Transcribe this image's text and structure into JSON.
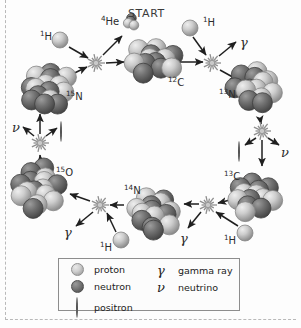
{
  "diagram": {
    "start_label": "START",
    "background": "#fdfdfd",
    "proton_color": "#cfcfcf",
    "neutron_color": "#6a6a6a",
    "arrow_color": "#1f1f1f",
    "burst_color": "#9a9a9a"
  },
  "nuclei": [
    {
      "name": "carbon-12",
      "label_sup": "12",
      "label_el": "C",
      "x": 150,
      "y": 60,
      "r": 27,
      "protons": 6,
      "neutrons": 6,
      "lx": 168,
      "ly": 76
    },
    {
      "name": "nitrogen-13",
      "label_sup": "13",
      "label_el": "N",
      "x": 258,
      "y": 90,
      "r": 27,
      "protons": 7,
      "neutrons": 6,
      "lx": 219,
      "ly": 88
    },
    {
      "name": "carbon-13",
      "label_sup": "13",
      "label_el": "C",
      "x": 258,
      "y": 196,
      "r": 27,
      "protons": 6,
      "neutrons": 7,
      "lx": 224,
      "ly": 170
    },
    {
      "name": "nitrogen-14",
      "label_sup": "14",
      "label_el": "N",
      "x": 150,
      "y": 212,
      "r": 27,
      "protons": 7,
      "neutrons": 7,
      "lx": 124,
      "ly": 184
    },
    {
      "name": "oxygen-15",
      "label_sup": "15",
      "label_el": "O",
      "x": 42,
      "y": 190,
      "r": 27,
      "protons": 8,
      "neutrons": 7,
      "lx": 56,
      "ly": 166
    },
    {
      "name": "nitrogen-15",
      "label_sup": "15",
      "label_el": "N",
      "x": 45,
      "y": 86,
      "r": 27,
      "protons": 7,
      "neutrons": 8,
      "lx": 66,
      "ly": 90
    },
    {
      "name": "helium-4",
      "label_sup": "4",
      "label_el": "He",
      "x": 131,
      "y": 22,
      "r": 13,
      "protons": 2,
      "neutrons": 2,
      "lx": 101,
      "ly": 15
    }
  ],
  "free_protons": [
    {
      "name": "proton-top-left",
      "label_sup": "1",
      "label_el": "H",
      "x": 60,
      "y": 40,
      "r": 8,
      "lx": 40,
      "ly": 30
    },
    {
      "name": "proton-top-right",
      "label_sup": "1",
      "label_el": "H",
      "x": 190,
      "y": 28,
      "r": 8,
      "lx": 203,
      "ly": 16
    },
    {
      "name": "proton-bottom-left",
      "label_sup": "1",
      "label_el": "H",
      "x": 121,
      "y": 240,
      "r": 8,
      "lx": 100,
      "ly": 241
    },
    {
      "name": "proton-bottom-right",
      "label_sup": "1",
      "label_el": "H",
      "x": 245,
      "y": 233,
      "r": 8,
      "lx": 224,
      "ly": 234
    }
  ],
  "reaction_bursts": [
    {
      "name": "burst-top-left",
      "x": 96,
      "y": 63,
      "r": 9
    },
    {
      "name": "burst-top-right",
      "x": 212,
      "y": 63,
      "r": 9
    },
    {
      "name": "burst-right-decay",
      "x": 262,
      "y": 131,
      "r": 9
    },
    {
      "name": "burst-bottom-right",
      "x": 208,
      "y": 205,
      "r": 9
    },
    {
      "name": "burst-bottom-left",
      "x": 100,
      "y": 205,
      "r": 9
    },
    {
      "name": "burst-left-decay",
      "x": 40,
      "y": 143,
      "r": 9
    }
  ],
  "emissions": [
    {
      "name": "gamma-top-right",
      "symbol": "γ",
      "x": 240,
      "y": 36
    },
    {
      "name": "neutrino-left",
      "symbol": "ν",
      "x": 12,
      "y": 121
    },
    {
      "name": "positron-left",
      "symbol": "○",
      "x": 60,
      "y": 124
    },
    {
      "name": "positron-right",
      "symbol": "○",
      "x": 238,
      "y": 144
    },
    {
      "name": "neutrino-right",
      "symbol": "ν",
      "x": 281,
      "y": 146
    },
    {
      "name": "gamma-bottom-left",
      "symbol": "γ",
      "x": 64,
      "y": 226
    },
    {
      "name": "gamma-bottom-right",
      "symbol": "γ",
      "x": 180,
      "y": 232
    }
  ],
  "legend": {
    "left_items": [
      {
        "name": "legend-proton",
        "glyph": "proton-sphere",
        "label": "proton"
      },
      {
        "name": "legend-neutron",
        "glyph": "neutron-sphere",
        "label": "neutron"
      },
      {
        "name": "legend-positron",
        "glyph": "positron-dot",
        "label": "positron"
      }
    ],
    "right_items": [
      {
        "name": "legend-gamma-ray",
        "symbol": "γ",
        "label": "gamma ray"
      },
      {
        "name": "legend-neutrino",
        "symbol": "ν",
        "label": "neutrino"
      }
    ]
  }
}
